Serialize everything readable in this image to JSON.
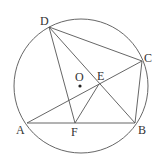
{
  "diagram": {
    "type": "geometry-circle-inscribed-quadrilateral",
    "circle": {
      "center": "O",
      "cx": 81,
      "cy": 86,
      "r": 67
    },
    "points": {
      "A": {
        "label": "A",
        "x": 27,
        "y": 123,
        "lx": 16,
        "ly": 134
      },
      "B": {
        "label": "B",
        "x": 135,
        "y": 123,
        "lx": 138,
        "ly": 134
      },
      "C": {
        "label": "C",
        "x": 142,
        "y": 61,
        "lx": 144,
        "ly": 62
      },
      "D": {
        "label": "D",
        "x": 49,
        "y": 27,
        "lx": 40,
        "ly": 25
      },
      "E": {
        "label": "E",
        "x": 99,
        "y": 84,
        "lx": 97,
        "ly": 80
      },
      "F": {
        "label": "F",
        "x": 75,
        "y": 123,
        "lx": 71,
        "ly": 136
      },
      "O": {
        "label": "O",
        "x": 80,
        "y": 86,
        "lx": 75,
        "ly": 81
      }
    },
    "segments": [
      [
        "A",
        "B"
      ],
      [
        "B",
        "C"
      ],
      [
        "C",
        "D"
      ],
      [
        "D",
        "F"
      ],
      [
        "D",
        "B"
      ],
      [
        "A",
        "C"
      ],
      [
        "E",
        "F"
      ]
    ],
    "colors": {
      "line": "#555555",
      "text": "#333333",
      "background": "#ffffff"
    }
  }
}
